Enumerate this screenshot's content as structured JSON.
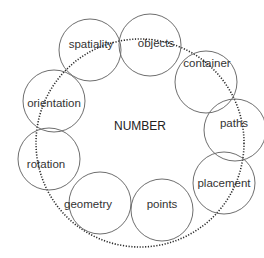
{
  "diagram": {
    "center_label": "NUMBER",
    "nodes": [
      {
        "label": "spatiality"
      },
      {
        "label": "objects"
      },
      {
        "label": "container"
      },
      {
        "label": "paths"
      },
      {
        "label": "placement"
      },
      {
        "label": "points"
      },
      {
        "label": "geometry"
      },
      {
        "label": "rotation"
      },
      {
        "label": "orientation"
      }
    ],
    "colors": {
      "circle_stroke": "#6e6e6e",
      "dotted_ring": "#2a2a2a",
      "text": "#333333",
      "background": "#ffffff"
    }
  }
}
